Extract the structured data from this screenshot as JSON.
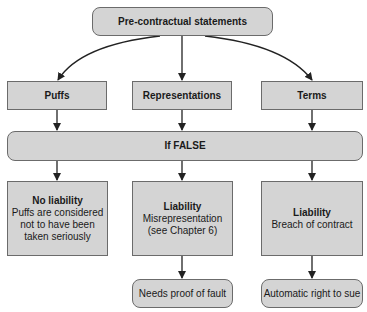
{
  "root": {
    "label": "Pre-contractual statements"
  },
  "categories": [
    {
      "label": "Puffs"
    },
    {
      "label": "Representations"
    },
    {
      "label": "Terms"
    }
  ],
  "condition": {
    "label": "If FALSE"
  },
  "outcomes": [
    {
      "title": "No liability",
      "lines": [
        "Puffs are considered",
        "not to have been",
        "taken seriously"
      ]
    },
    {
      "title": "Liability",
      "lines": [
        "Misrepresentation",
        "(see Chapter 6)"
      ]
    },
    {
      "title": "Liability",
      "lines": [
        "Breach of contract"
      ]
    }
  ],
  "consequences": [
    {
      "label": "Needs proof of fault"
    },
    {
      "label": "Automatic right to sue"
    }
  ],
  "colors": {
    "box_fill": "#d4d4d4",
    "border": "#6b6b6b",
    "arrow": "#222222"
  }
}
